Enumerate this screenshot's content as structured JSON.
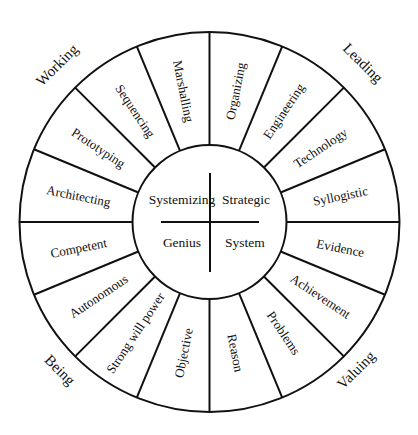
{
  "diagram": {
    "type": "wheel",
    "geometry": {
      "cx": 209.5,
      "cy": 222,
      "outer_r": 190,
      "inner_r": 77,
      "segment_count": 16
    },
    "colors": {
      "line": "#111111",
      "text": "#111111",
      "background": "#ffffff"
    },
    "core": {
      "quadrants": [
        {
          "id": "top-left",
          "label": "Systemizing"
        },
        {
          "id": "top-right",
          "label": "Strategic"
        },
        {
          "id": "bottom-left",
          "label": "Genius"
        },
        {
          "id": "bottom-right",
          "label": "System"
        }
      ]
    },
    "outer_labels": [
      {
        "id": "working",
        "label": "Working"
      },
      {
        "id": "leading",
        "label": "Leading"
      },
      {
        "id": "being",
        "label": "Being"
      },
      {
        "id": "valuing",
        "label": "Valuing"
      }
    ],
    "segments": [
      {
        "label": "Organizing",
        "quadrant": "Leading"
      },
      {
        "label": "Engineering",
        "quadrant": "Leading"
      },
      {
        "label": "Technology",
        "quadrant": "Leading"
      },
      {
        "label": "Syllogistic",
        "quadrant": "Leading"
      },
      {
        "label": "Evidence",
        "quadrant": "Valuing"
      },
      {
        "label": "Achievement",
        "quadrant": "Valuing"
      },
      {
        "label": "Problems",
        "quadrant": "Valuing"
      },
      {
        "label": "Reason",
        "quadrant": "Valuing"
      },
      {
        "label": "Objective",
        "quadrant": "Being"
      },
      {
        "label": "Strong will power",
        "quadrant": "Being"
      },
      {
        "label": "Autonomous",
        "quadrant": "Being"
      },
      {
        "label": "Competent",
        "quadrant": "Being"
      },
      {
        "label": "Architecting",
        "quadrant": "Working"
      },
      {
        "label": "Prototyping",
        "quadrant": "Working"
      },
      {
        "label": "Sequencing",
        "quadrant": "Working"
      },
      {
        "label": "Marshalling",
        "quadrant": "Working"
      }
    ]
  }
}
